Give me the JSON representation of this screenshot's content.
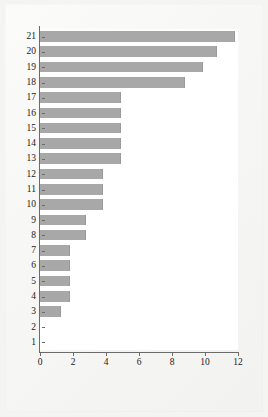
{
  "figure": {
    "background_color": "#f4f4f2",
    "plot_background_color": "#ffffff",
    "bar_color": "#a8a8a8",
    "axis_color": "#6b6b6b",
    "text_color": "#1a1a1a"
  },
  "chart_data": {
    "type": "bar",
    "orientation": "horizontal",
    "title": "",
    "subtitle": "",
    "xlabel": "",
    "ylabel": "",
    "categories": [
      "1",
      "2",
      "3",
      "4",
      "5",
      "6",
      "7",
      "8",
      "9",
      "10",
      "11",
      "12",
      "13",
      "14",
      "15",
      "16",
      "17",
      "18",
      "19",
      "20",
      "21"
    ],
    "values": [
      0,
      0,
      1.3,
      1.8,
      1.8,
      1.8,
      1.8,
      2.8,
      2.8,
      3.8,
      3.8,
      3.8,
      4.9,
      4.9,
      4.9,
      4.9,
      4.9,
      8.8,
      9.9,
      10.7,
      11.8
    ],
    "xlim": [
      0,
      12
    ],
    "ylim": [
      0.5,
      21.5
    ],
    "xticks": [
      0,
      2,
      4,
      6,
      8,
      10,
      12
    ],
    "xtick_labels": [
      "0",
      "2",
      "4",
      "6",
      "8",
      "10",
      "12"
    ],
    "ytick_labels": [
      "1",
      "2",
      "3",
      "4",
      "5",
      "6",
      "7",
      "8",
      "9",
      "10",
      "11",
      "12",
      "13",
      "14",
      "15",
      "16",
      "17",
      "18",
      "19",
      "20",
      "21"
    ],
    "grid": false,
    "legend": null,
    "legend_position": "none",
    "annotations": []
  }
}
